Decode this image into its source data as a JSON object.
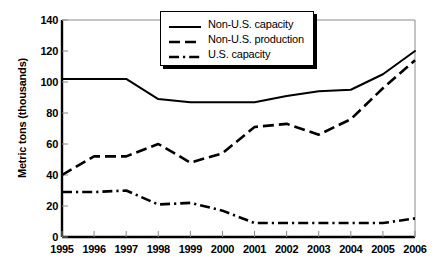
{
  "chart_data": {
    "type": "line",
    "title": "",
    "xlabel": "",
    "ylabel": "Metric tons (thousands)",
    "categories": [
      "1995",
      "1996",
      "1997",
      "1998",
      "1999",
      "2000",
      "2001",
      "2002",
      "2003",
      "2004",
      "2005",
      "2006"
    ],
    "x": [
      1995,
      1996,
      1997,
      1998,
      1999,
      2000,
      2001,
      2002,
      2003,
      2004,
      2005,
      2006
    ],
    "ylim": [
      0,
      140
    ],
    "yticks": [
      0,
      20,
      40,
      60,
      80,
      100,
      120,
      140
    ],
    "grid": false,
    "legend_position": "top-center",
    "series": [
      {
        "name": "Non-U.S. capacity",
        "style": "solid",
        "values": [
          102,
          102,
          102,
          89,
          87,
          87,
          87,
          91,
          94,
          95,
          105,
          120
        ]
      },
      {
        "name": "Non-U.S. production",
        "style": "dashed",
        "values": [
          40,
          52,
          52,
          60,
          48,
          54,
          71,
          73,
          66,
          76,
          96,
          114
        ]
      },
      {
        "name": "U.S. capacity",
        "style": "dash-dot",
        "values": [
          29,
          29,
          30,
          21,
          22,
          17,
          9,
          9,
          9,
          9,
          9,
          12
        ]
      }
    ]
  },
  "legend": {
    "items": [
      {
        "label": "Non-U.S. capacity",
        "key": "solid-line-key"
      },
      {
        "label": "Non-U.S. production",
        "key": "dashed-line-key"
      },
      {
        "label": "U.S. capacity",
        "key": "dash-dot-line-key"
      }
    ]
  },
  "colors": {
    "line": "#000000",
    "axis": "#000000",
    "background": "#ffffff"
  }
}
